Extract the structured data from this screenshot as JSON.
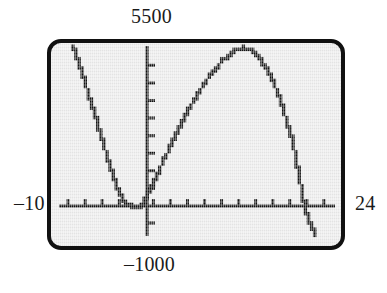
{
  "figure": {
    "kind": "graphing-calculator-screen",
    "labels": {
      "top": "5500",
      "bottom": "–1000",
      "left": "–10",
      "right": "24"
    },
    "colors": {
      "screen_background": "#e9e9e9",
      "frame_stroke": "#111111",
      "ink": "#111111",
      "page_background": "#ffffff",
      "text": "#1a1a1a"
    }
  },
  "chart_data": {
    "type": "line",
    "title": "",
    "xlabel": "",
    "ylabel": "",
    "xlim": [
      -10,
      24
    ],
    "ylim": [
      -1000,
      5500
    ],
    "grid": false,
    "legend": null,
    "axis_labels_shown": {
      "xmin": "–10",
      "xmax": "24",
      "ymin": "–1000",
      "ymax": "5500"
    },
    "x_axis": {
      "position_y_value": 0,
      "tick_spacing_value": 2,
      "tick_count": 16
    },
    "y_axis": {
      "position_x_value": 0,
      "tick_spacing_value": 500,
      "ticks_above": 8,
      "ticks_below": 2
    },
    "annotations": [
      "x-intercept near x = -4.2",
      "x-intercept near x = 0.4",
      "local maximum near x = 12.6",
      "x-intercept near x = 19.1"
    ],
    "series": [
      {
        "name": "polynomial",
        "style": "pixelated-stairstep",
        "x": [
          -7.4,
          -7.0,
          -6.6,
          -6.2,
          -5.8,
          -5.4,
          -5.0,
          -4.6,
          -4.2,
          -3.8,
          -3.4,
          -3.0,
          -2.6,
          -2.2,
          -1.8,
          -1.4,
          -1.0,
          -0.6,
          -0.2,
          0.2,
          0.4,
          0.8,
          1.4,
          2.0,
          2.8,
          3.6,
          4.4,
          5.2,
          6.0,
          6.8,
          7.6,
          8.4,
          9.2,
          10.0,
          10.8,
          11.6,
          12.2,
          12.6,
          13.2,
          13.8,
          14.6,
          15.4,
          16.2,
          17.0,
          17.8,
          18.4,
          19.1,
          19.8,
          20.4,
          21.0
        ],
        "y": [
          5450,
          5180,
          4800,
          4420,
          4040,
          3660,
          3270,
          2880,
          2480,
          2090,
          1700,
          1320,
          960,
          640,
          380,
          190,
          80,
          20,
          0,
          -10,
          0,
          120,
          420,
          820,
          1320,
          1820,
          2320,
          2790,
          3240,
          3660,
          4050,
          4400,
          4720,
          4980,
          5180,
          5340,
          5420,
          5450,
          5400,
          5280,
          5030,
          4660,
          4160,
          3530,
          2770,
          2100,
          1000,
          -90,
          -600,
          -1000
        ]
      }
    ]
  }
}
